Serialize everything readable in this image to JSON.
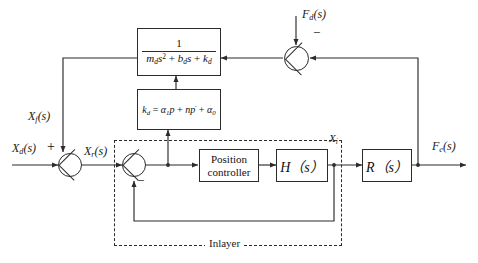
{
  "diagram": {
    "type": "control-block-diagram",
    "colors": {
      "line": "#2b2b2b",
      "text": "#111111",
      "background": "#ffffff"
    },
    "blocks": {
      "admittance": {
        "numerator": "1",
        "denominator_md": "m",
        "denominator_md_sub": "d",
        "denominator_s2": "s",
        "denominator_s2_sup": "2",
        "denominator_plus1": "+",
        "denominator_bd": "b",
        "denominator_bd_sub": "d",
        "denominator_s": "s",
        "denominator_plus2": "+",
        "denominator_kd": "k",
        "denominator_kd_sub": "d",
        "plain": "1 / (m_d s^2 + b_d s + k_d)"
      },
      "stiffness": {
        "kd": "k",
        "kd_sub": "d",
        "eq": "=",
        "a1": "α",
        "a1_sub": "1",
        "p": "p",
        "plus1": "+",
        "n": "n",
        "p2": "p",
        "prime": "'",
        "plus2": "+",
        "a0": "α",
        "a0_sub": "0",
        "plain": "k_d = α₁p + np' + α₀"
      },
      "position_controller": {
        "line1": "Position",
        "line2": "controller"
      },
      "h_block": {
        "symbol": "H",
        "arg": "（s）"
      },
      "r_block": {
        "symbol": "R",
        "arg": "（s）"
      }
    },
    "signals": {
      "xd": {
        "base": "X",
        "sub": "d",
        "arg": "(s)"
      },
      "xf": {
        "base": "X",
        "sub": "f",
        "arg": "(s)"
      },
      "xr": {
        "base": "X",
        "sub": "r",
        "arg": "(s)"
      },
      "xi": {
        "base": "X",
        "sub": "i",
        "arg": ""
      },
      "fd": {
        "base": "F",
        "sub": "d",
        "arg": "(s)"
      },
      "fe": {
        "base": "F",
        "sub": "e",
        "arg": "(s)"
      }
    },
    "signs": {
      "outer_sum_plus": "+",
      "inner_sum_minus": "−",
      "force_sum_minus": "−"
    },
    "regions": {
      "inlayer_label": "Inlayer"
    }
  }
}
